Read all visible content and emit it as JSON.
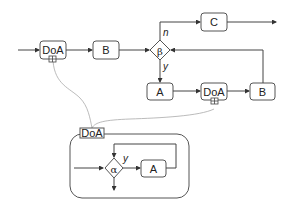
{
  "diagram": {
    "main_flow": {
      "doa1": "DoA",
      "b1": "B",
      "beta": "β",
      "beta_no_label": "n",
      "beta_yes_label": "y",
      "c": "C",
      "a": "A",
      "doa2": "DoA",
      "b2": "B"
    },
    "subprocess": {
      "title": "DoA",
      "alpha": "α",
      "alpha_yes_label": "y",
      "a": "A"
    },
    "colors": {
      "stroke": "#444444",
      "link": "#aaaaaa"
    }
  }
}
